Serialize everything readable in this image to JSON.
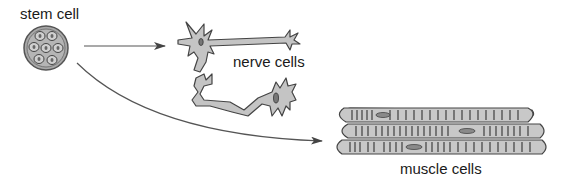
{
  "diagram": {
    "type": "stem cell differentiation",
    "nodes": [
      {
        "id": "stem",
        "label": "stem cell",
        "icon": "stem-cell-icon"
      },
      {
        "id": "nerve",
        "label": "nerve cells",
        "icon": "nerve-cells-icon"
      },
      {
        "id": "muscle",
        "label": "muscle cells",
        "icon": "muscle-cells-icon"
      }
    ],
    "edges": [
      {
        "from": "stem",
        "to": "nerve",
        "style": "straight-arrow"
      },
      {
        "from": "stem",
        "to": "muscle",
        "style": "curved-arrow"
      }
    ],
    "colors": {
      "cell_fill": "#c8c8c8",
      "cell_stroke": "#4a4a4a",
      "nucleus_fill": "#8a8a8a",
      "arrow": "#555555",
      "text": "#1a1a1a"
    }
  }
}
